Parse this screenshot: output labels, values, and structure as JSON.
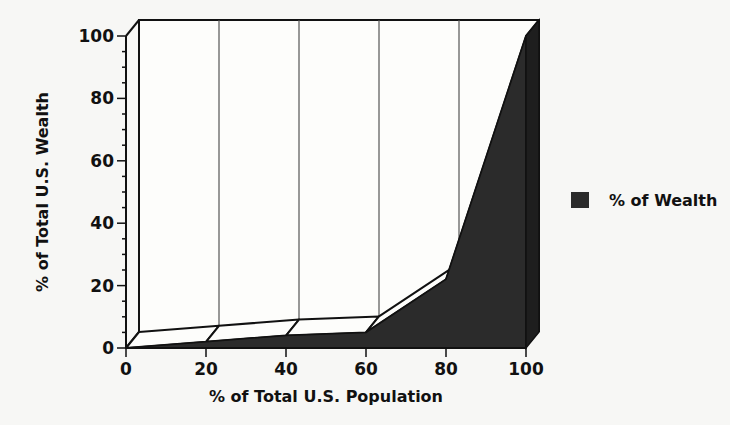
{
  "chart_data": {
    "type": "area",
    "style": "3d",
    "title": "",
    "xlabel": "% of Total U.S. Population",
    "ylabel": "% of Total U.S. Wealth",
    "x": [
      0,
      20,
      40,
      60,
      80,
      100
    ],
    "series": [
      {
        "name": "% of Wealth",
        "values": [
          0,
          2,
          4,
          5,
          22,
          100
        ],
        "color": "#2b2b2b"
      }
    ],
    "xlim": [
      0,
      100
    ],
    "ylim": [
      0,
      100
    ],
    "x_ticks": [
      "0",
      "20",
      "40",
      "60",
      "80",
      "100"
    ],
    "y_ticks": [
      "0",
      "20",
      "40",
      "60",
      "80",
      "100"
    ],
    "grid": {
      "vertical": true,
      "horizontal": false
    },
    "legend": {
      "position": "right",
      "entries": [
        "% of Wealth"
      ]
    }
  },
  "colors": {
    "fill": "#2b2b2b",
    "line": "#111111",
    "background": "#f7f7f5"
  }
}
